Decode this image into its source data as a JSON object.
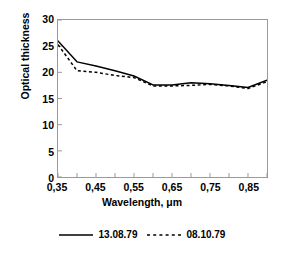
{
  "chart_data": {
    "type": "line",
    "title": "",
    "xlabel": "Wavelength,  μm",
    "ylabel": "Optical thickness",
    "xlim": [
      0.35,
      0.9
    ],
    "ylim": [
      0,
      30
    ],
    "grid": false,
    "legend_position": "bottom",
    "xticks": [
      0.35,
      0.45,
      0.55,
      0.65,
      0.75,
      0.85
    ],
    "xtick_labels": [
      "0,35",
      "0,45",
      "0,55",
      "0,65",
      "0,75",
      "0,85"
    ],
    "xtick_minor_step": 0.05,
    "yticks": [
      0,
      5,
      10,
      15,
      20,
      25,
      30
    ],
    "ytick_labels": [
      "0",
      "5",
      "10",
      "15",
      "20",
      "25",
      "30"
    ],
    "x": [
      0.35,
      0.4,
      0.45,
      0.5,
      0.55,
      0.6,
      0.65,
      0.7,
      0.75,
      0.8,
      0.85,
      0.9
    ],
    "series": [
      {
        "name": "13.08.79",
        "style": "solid",
        "color": "#000000",
        "values": [
          26.0,
          22.0,
          21.2,
          20.3,
          19.3,
          17.6,
          17.6,
          18.0,
          17.8,
          17.5,
          17.1,
          18.5
        ]
      },
      {
        "name": "08.10.79",
        "style": "dashed",
        "color": "#000000",
        "values": [
          25.3,
          20.3,
          20.0,
          19.4,
          19.0,
          17.4,
          17.4,
          17.5,
          17.7,
          17.4,
          16.9,
          18.2
        ]
      }
    ]
  },
  "legend": {
    "entries": [
      {
        "label": "13.08.79",
        "style": "solid"
      },
      {
        "label": "08.10.79",
        "style": "dashed"
      }
    ]
  }
}
